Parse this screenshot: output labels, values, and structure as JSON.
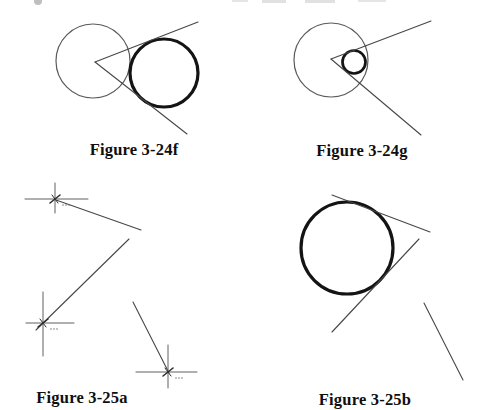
{
  "page": {
    "width": 491,
    "height": 410,
    "background": "#ffffff"
  },
  "colors": {
    "thin": "#5a5a5a",
    "line": "#474747",
    "thick": "#141414",
    "marker": "#606060",
    "tick": "#2e2e2e",
    "label": "#0f0f0f"
  },
  "figures": [
    {
      "id": "figure-3-24f",
      "caption": "Figure 3-24f",
      "circles": [
        {
          "name": "large-thin-circle",
          "cx": 93,
          "cy": 61,
          "r": 37,
          "color": "thin",
          "w": 1.2
        },
        {
          "name": "large-thick-circle",
          "cx": 164,
          "cy": 73,
          "r": 34,
          "color": "thick",
          "w": 3.2
        }
      ],
      "lines": [
        {
          "name": "upper-angle-ray",
          "x1": 95,
          "y1": 62,
          "x2": 198,
          "y2": 22,
          "color": "line",
          "w": 1.1
        },
        {
          "name": "lower-angle-ray",
          "x1": 95,
          "y1": 62,
          "x2": 187,
          "y2": 134,
          "color": "line",
          "w": 1.1
        }
      ],
      "markers": []
    },
    {
      "id": "figure-3-24g",
      "caption": "Figure 3-24g",
      "circles": [
        {
          "name": "large-thin-circle",
          "cx": 331,
          "cy": 60,
          "r": 37,
          "color": "thin",
          "w": 1.2
        },
        {
          "name": "small-thick-circle",
          "cx": 354,
          "cy": 62,
          "r": 11.5,
          "color": "thick",
          "w": 2.7
        }
      ],
      "lines": [
        {
          "name": "upper-angle-ray",
          "x1": 331,
          "y1": 59,
          "x2": 431,
          "y2": 21,
          "color": "line",
          "w": 1.1
        },
        {
          "name": "lower-angle-ray",
          "x1": 331,
          "y1": 59,
          "x2": 421,
          "y2": 135,
          "color": "line",
          "w": 1.1
        }
      ],
      "markers": []
    },
    {
      "id": "figure-3-25a",
      "caption": "Figure 3-25a",
      "circles": [],
      "lines": [
        {
          "name": "construction-segment",
          "x1": 56,
          "y1": 200,
          "x2": 141,
          "y2": 230,
          "color": "line",
          "w": 1.1
        },
        {
          "name": "construction-segment",
          "x1": 129,
          "y1": 239,
          "x2": 36,
          "y2": 330,
          "color": "line",
          "w": 1.1
        },
        {
          "name": "construction-segment",
          "x1": 133,
          "y1": 302,
          "x2": 169,
          "y2": 373,
          "color": "line",
          "w": 1.1
        }
      ],
      "markers": [
        {
          "name": "point-marker",
          "cx": 55,
          "cy": 199,
          "hx1": 25,
          "hx2": 88,
          "vy1": 183,
          "vy2": 213
        },
        {
          "name": "point-marker",
          "cx": 43,
          "cy": 323,
          "hx1": 26,
          "hx2": 74,
          "vy1": 292,
          "vy2": 356
        },
        {
          "name": "point-marker",
          "cx": 168,
          "cy": 372,
          "hx1": 136,
          "hx2": 197,
          "vy1": 345,
          "vy2": 388
        }
      ]
    },
    {
      "id": "figure-3-25b",
      "caption": "Figure 3-25b",
      "circles": [
        {
          "name": "large-thick-circle",
          "cx": 347,
          "cy": 248,
          "r": 46,
          "color": "thick",
          "w": 3.2
        }
      ],
      "lines": [
        {
          "name": "upper-tangent-line",
          "x1": 332,
          "y1": 195,
          "x2": 430,
          "y2": 232,
          "color": "line",
          "w": 1.1
        },
        {
          "name": "lower-tangent-line",
          "x1": 419,
          "y1": 239,
          "x2": 332,
          "y2": 332,
          "color": "line",
          "w": 1.1
        },
        {
          "name": "detached-segment",
          "x1": 424,
          "y1": 303,
          "x2": 463,
          "y2": 380,
          "color": "line",
          "w": 1.1
        }
      ],
      "markers": []
    }
  ]
}
